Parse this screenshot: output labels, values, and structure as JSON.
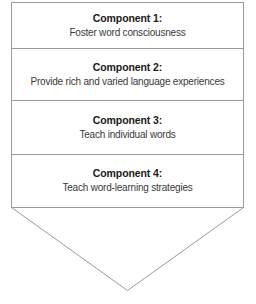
{
  "diagram": {
    "shape": "down-arrow-banner",
    "stroke_color": "#9a9a9a",
    "fill_color": "#ffffff",
    "title_color": "#1a1a1a",
    "desc_color": "#3a3a3a",
    "components": [
      {
        "title": "Component 1:",
        "description": "Foster word consciousness"
      },
      {
        "title": "Component 2:",
        "description": "Provide rich and varied language experiences"
      },
      {
        "title": "Component 3:",
        "description": "Teach individual words"
      },
      {
        "title": "Component 4:",
        "description": "Teach word-learning strategies"
      }
    ]
  }
}
